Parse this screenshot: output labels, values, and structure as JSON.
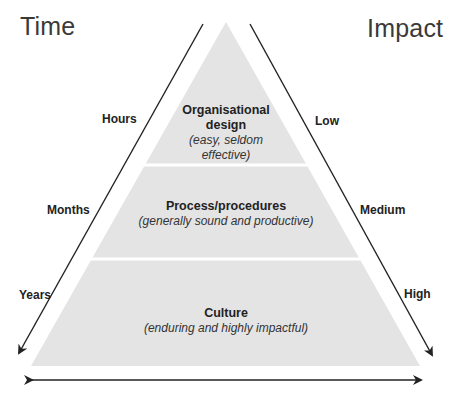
{
  "titles": {
    "left": "Time",
    "right": "Impact"
  },
  "time_axis": {
    "labels": [
      "Hours",
      "Months",
      "Years"
    ]
  },
  "impact_axis": {
    "labels": [
      "Low",
      "Medium",
      "High"
    ]
  },
  "layers": [
    {
      "title": "Organisational design",
      "title_line1": "Organisational",
      "title_line2": "design",
      "subtitle": "(easy, seldom effective)",
      "subtitle_line1": "(easy, seldom",
      "subtitle_line2": "effective)"
    },
    {
      "title": "Process/procedures",
      "subtitle": "(generally sound and productive)"
    },
    {
      "title": "Culture",
      "subtitle": "(enduring and highly impactful)"
    }
  ],
  "colors": {
    "pyramid_fill": "#e4e4e4",
    "divider": "#ffffff",
    "arrow": "#222222",
    "background": "#ffffff"
  }
}
